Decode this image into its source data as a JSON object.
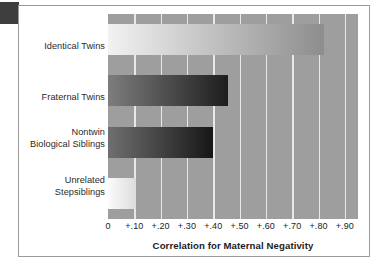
{
  "chart_data": {
    "type": "bar",
    "orientation": "horizontal",
    "title": "",
    "xlabel": "Correlation for Maternal Negativity",
    "ylabel": "",
    "categories": [
      "Identical Twins",
      "Fraternal Twins",
      "Nontwin Biological Siblings",
      "Unrelated Stepsiblings"
    ],
    "values": [
      0.82,
      0.455,
      0.4,
      0.105
    ],
    "xlim": [
      0,
      0.95
    ],
    "xticks": [
      0,
      0.1,
      0.2,
      0.3,
      0.4,
      0.5,
      0.6,
      0.7,
      0.8,
      0.9
    ],
    "xticklabels": [
      "0",
      "+.10",
      "+.20",
      "+.30",
      "+.40",
      "+.50",
      "+.60",
      "+.70",
      "+.80",
      "+.90"
    ],
    "grid": "vertical-only",
    "legend": "none",
    "plot_background": "#9e9e9e",
    "gridline_color": "#e8e8e8"
  },
  "categories": [
    {
      "lines": [
        "Identical Twins"
      ]
    },
    {
      "lines": [
        "Fraternal Twins"
      ]
    },
    {
      "lines": [
        "Nontwin",
        "Biological Siblings"
      ]
    },
    {
      "lines": [
        "Unrelated",
        "Stepsiblings"
      ]
    }
  ],
  "axis": {
    "xlabel": "Correlation for Maternal Negativity",
    "ticks": [
      "0",
      "+.10",
      "+.20",
      "+.30",
      "+.40",
      "+.50",
      "+.60",
      "+.70",
      "+.80",
      "+.90"
    ]
  },
  "bars": [
    {
      "name": "identical-twins",
      "value": 0.82,
      "gradient_start": "#f2f2f2",
      "gradient_end": "#8d8d8d"
    },
    {
      "name": "fraternal-twins",
      "value": 0.455,
      "gradient_start": "#7d7d7d",
      "gradient_end": "#1d1d1d"
    },
    {
      "name": "nontwin-biological-siblings",
      "value": 0.4,
      "gradient_start": "#6f6f6f",
      "gradient_end": "#161616"
    },
    {
      "name": "unrelated-stepsiblings",
      "value": 0.105,
      "gradient_start": "#fbfbfb",
      "gradient_end": "#dcdcdc"
    }
  ]
}
